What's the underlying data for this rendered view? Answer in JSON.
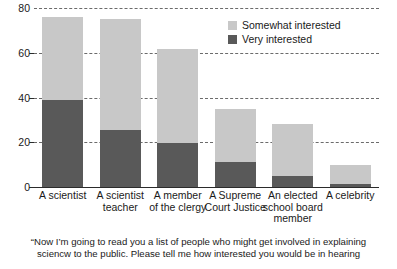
{
  "chart_data": {
    "type": "bar",
    "stacked": true,
    "title": "",
    "xlabel": "",
    "ylabel": "",
    "ylim": [
      0,
      80
    ],
    "yticks": [
      0,
      20,
      40,
      60,
      80
    ],
    "grid": "horizontal-dashed",
    "legend_position": "top-right",
    "categories": [
      "A scientist",
      "A scientist teacher",
      "A member of the clergy",
      "A Supreme Court Justice",
      "An elected school board member",
      "A celebrity"
    ],
    "category_lines": [
      [
        "A scientist"
      ],
      [
        "A scientist",
        "teacher"
      ],
      [
        "A member",
        "of the clergy"
      ],
      [
        "A Supreme",
        "Court Justice"
      ],
      [
        "An elected",
        "school board",
        "member"
      ],
      [
        "A celebrity"
      ]
    ],
    "series": [
      {
        "name": "Very interested",
        "color": "#595959",
        "values": [
          39,
          25.5,
          19.5,
          11,
          5,
          1.5
        ]
      },
      {
        "name": "Somewhat interested",
        "color": "#c8c8c8",
        "values": [
          37,
          49.5,
          42,
          24,
          23,
          8.5
        ]
      }
    ],
    "totals": [
      76,
      75,
      61.5,
      35,
      28,
      10
    ],
    "caption_lines": [
      "“Now I’m going to read you a list of people who might get involved in explaining",
      "sciencw to the public. Please tell me how interested you would be in hearing"
    ]
  },
  "legend": {
    "items": [
      {
        "label": "Somewhat interested",
        "color": "#c8c8c8"
      },
      {
        "label": "Very interested",
        "color": "#595959"
      }
    ]
  },
  "axis": {
    "y_tick_labels": [
      "80",
      "60",
      "40",
      "20",
      "0"
    ]
  }
}
